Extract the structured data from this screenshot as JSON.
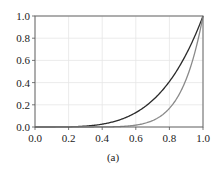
{
  "chart_data": {
    "type": "line",
    "title": "",
    "caption": "(a)",
    "xlabel": "",
    "ylabel": "",
    "xlim": [
      0.0,
      1.0
    ],
    "ylim": [
      0.0,
      1.0
    ],
    "xticks": [
      "0.0",
      "0.2",
      "0.4",
      "0.6",
      "0.8",
      "1.0"
    ],
    "yticks": [
      "0.0",
      "0.2",
      "0.4",
      "0.6",
      "0.8",
      "1.0"
    ],
    "grid": true,
    "legend": null,
    "series": [
      {
        "name": "dark curve",
        "color": "#2b2b2b",
        "x": [
          0.0,
          0.1,
          0.2,
          0.3,
          0.4,
          0.5,
          0.6,
          0.7,
          0.8,
          0.9,
          1.0
        ],
        "values": [
          0.0,
          0.0001,
          0.0016,
          0.0081,
          0.0256,
          0.0625,
          0.1296,
          0.2401,
          0.4096,
          0.6561,
          1.0
        ]
      },
      {
        "name": "gray curve",
        "color": "#8a8a8a",
        "x": [
          0.0,
          0.1,
          0.2,
          0.3,
          0.4,
          0.5,
          0.6,
          0.7,
          0.8,
          0.9,
          1.0
        ],
        "values": [
          0.0,
          0.0,
          0.0,
          0.0001,
          0.0007,
          0.0039,
          0.0168,
          0.0576,
          0.1678,
          0.4305,
          1.0
        ]
      }
    ]
  }
}
